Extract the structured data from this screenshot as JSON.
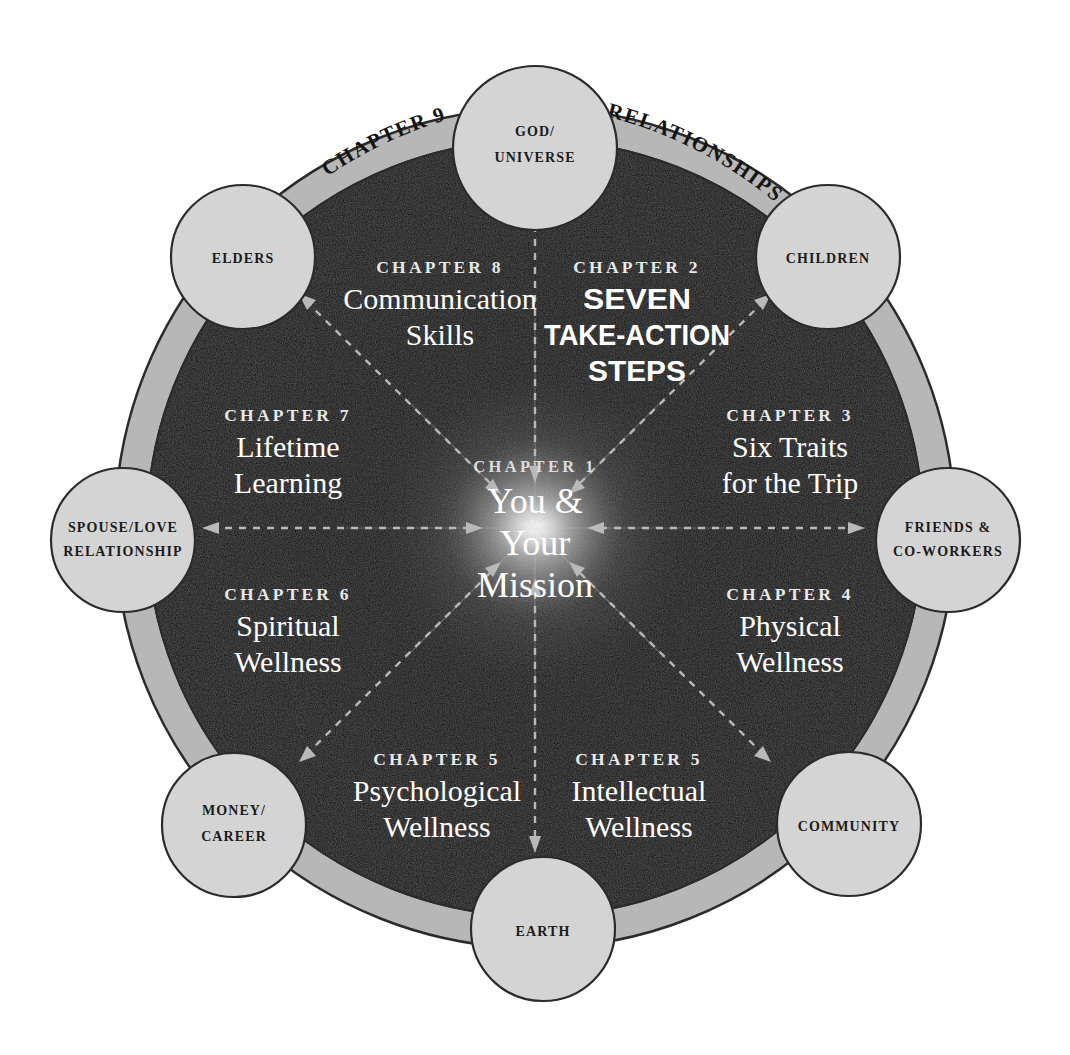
{
  "diagram": {
    "center": {
      "chapter_label": "CHAPTER 1",
      "title_lines": [
        "You &",
        "Your",
        "Mission"
      ]
    },
    "ring_labels": [
      {
        "name": "chapter-9-arc",
        "text": "CHAPTER 9"
      },
      {
        "name": "relationships-arc",
        "text": "RELATIONSHIPS"
      }
    ],
    "segments": [
      {
        "id": "chapter-8",
        "chapter_label": "CHAPTER 8",
        "title_lines": [
          "Communication",
          "Skills"
        ],
        "style": "serif"
      },
      {
        "id": "chapter-2",
        "chapter_label": "CHAPTER 2",
        "title_lines": [
          "SEVEN",
          "TAKE-ACTION",
          "STEPS"
        ],
        "style": "bold-condensed"
      },
      {
        "id": "chapter-7",
        "chapter_label": "CHAPTER 7",
        "title_lines": [
          "Lifetime",
          "Learning"
        ],
        "style": "serif"
      },
      {
        "id": "chapter-3",
        "chapter_label": "CHAPTER 3",
        "title_lines": [
          "Six Traits",
          "for the Trip"
        ],
        "style": "serif"
      },
      {
        "id": "chapter-6",
        "chapter_label": "CHAPTER 6",
        "title_lines": [
          "Spiritual",
          "Wellness"
        ],
        "style": "serif"
      },
      {
        "id": "chapter-4",
        "chapter_label": "CHAPTER 4",
        "title_lines": [
          "Physical",
          "Wellness"
        ],
        "style": "serif"
      },
      {
        "id": "chapter-5-psychological",
        "chapter_label": "CHAPTER 5",
        "title_lines": [
          "Psychological",
          "Wellness"
        ],
        "style": "serif"
      },
      {
        "id": "chapter-5-intellectual",
        "chapter_label": "CHAPTER 5",
        "title_lines": [
          "Intellectual",
          "Wellness"
        ],
        "style": "serif"
      }
    ],
    "nodes": [
      {
        "id": "god-universe",
        "lines": [
          "GOD/",
          "UNIVERSE"
        ],
        "angle_deg": 270
      },
      {
        "id": "children",
        "lines": [
          "CHILDREN"
        ],
        "angle_deg": 315
      },
      {
        "id": "friends-co-workers",
        "lines": [
          "FRIENDS &",
          "CO-WORKERS"
        ],
        "angle_deg": 0
      },
      {
        "id": "community",
        "lines": [
          "COMMUNITY"
        ],
        "angle_deg": 45
      },
      {
        "id": "earth",
        "lines": [
          "EARTH"
        ],
        "angle_deg": 90
      },
      {
        "id": "money-career",
        "lines": [
          "MONEY/",
          "CAREER"
        ],
        "angle_deg": 135
      },
      {
        "id": "spouse-love",
        "lines": [
          "SPOUSE/LOVE",
          "RELATIONSHIP"
        ],
        "angle_deg": 180
      },
      {
        "id": "elders",
        "lines": [
          "ELDERS"
        ],
        "angle_deg": 225
      }
    ],
    "colors": {
      "background": "#ffffff",
      "ring": "#b7b7b7",
      "ring_outline": "#2b2b2b",
      "disc_dark": "#0a0a0a",
      "node_fill": "#d4d4d4",
      "node_stroke": "#2b2b2b",
      "text_light": "#ffffff",
      "text_dark": "#1b1b1b",
      "arrow": "#b9b9b9"
    }
  }
}
